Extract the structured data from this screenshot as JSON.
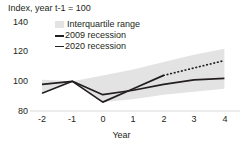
{
  "chart_data": {
    "type": "line",
    "title": "Index, year t-1 = 100",
    "xlabel": "Year",
    "ylabel": "",
    "x": [
      -2,
      -1,
      0,
      1,
      2,
      3,
      4
    ],
    "xtick_labels": [
      "-2",
      "-1",
      "0",
      "1",
      "2",
      "3",
      "4"
    ],
    "ytick_labels": [
      "140",
      "120",
      "100",
      "80"
    ],
    "yticks": [
      140,
      120,
      100,
      80
    ],
    "ylim": [
      80,
      140
    ],
    "xlim": [
      -2,
      4
    ],
    "grid": false,
    "legend_position": "top-left-inside",
    "band": {
      "name": "Interquartile range",
      "color": "#e3e3e3",
      "upper": [
        101,
        100,
        104,
        108,
        113,
        118,
        122
      ],
      "lower": [
        93,
        100,
        86,
        88,
        91,
        93,
        95
      ]
    },
    "series": [
      {
        "name": "2009 recession",
        "color": "#231f20",
        "style": "solid",
        "values": [
          98,
          100,
          91,
          94,
          98,
          101,
          102
        ]
      },
      {
        "name": "2020 recession",
        "color": "#231f20",
        "style": "solid-then-dotted",
        "solid_through_x": 2,
        "values": [
          92,
          100,
          86,
          95,
          104,
          109,
          114
        ]
      }
    ]
  },
  "axis_note": "Index, year t-1 = 100",
  "legend": {
    "band_label": "Interquartile range",
    "series_2009_label": "2009 recession",
    "series_2020_label": "2020 recession"
  },
  "xaxis": {
    "label": "Year",
    "ticks": [
      "-2",
      "-1",
      "0",
      "1",
      "2",
      "3",
      "4"
    ]
  },
  "yaxis": {
    "ticks": [
      "140",
      "120",
      "100",
      "80"
    ]
  }
}
